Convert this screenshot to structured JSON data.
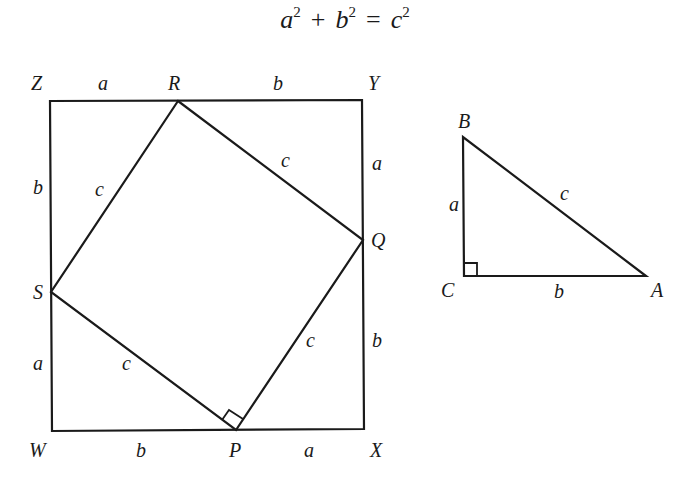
{
  "equation": {
    "a": "a",
    "a_exp": "2",
    "plus": "+",
    "b": "b",
    "b_exp": "2",
    "equals": "=",
    "c": "c",
    "c_exp": "2"
  },
  "square_figure": {
    "vertices": {
      "Z": {
        "label": "Z",
        "x": 50,
        "y": 101
      },
      "Y": {
        "label": "Y",
        "x": 362,
        "y": 100
      },
      "X": {
        "label": "X",
        "x": 364,
        "y": 429
      },
      "W": {
        "label": "W",
        "x": 52,
        "y": 431
      },
      "R": {
        "label": "R",
        "x": 178,
        "y": 101
      },
      "Q": {
        "label": "Q",
        "x": 363,
        "y": 240
      },
      "P": {
        "label": "P",
        "x": 236,
        "y": 430
      },
      "S": {
        "label": "S",
        "x": 51,
        "y": 292
      }
    },
    "side_labels": {
      "ZR": "a",
      "RY": "b",
      "YQ": "a",
      "QX": "b",
      "WP": "b",
      "PX": "a",
      "ZS": "b",
      "SW": "a",
      "RQ": "c",
      "SR": "c",
      "SP": "c",
      "PQ": "c"
    },
    "right_angle_at": "P"
  },
  "triangle_figure": {
    "vertices": {
      "B": {
        "label": "B",
        "x": 463,
        "y": 137
      },
      "C": {
        "label": "C",
        "x": 464,
        "y": 276
      },
      "A": {
        "label": "A",
        "x": 646,
        "y": 276
      }
    },
    "side_labels": {
      "BC": "a",
      "CA": "b",
      "AB": "c"
    },
    "right_angle_at": "C"
  }
}
